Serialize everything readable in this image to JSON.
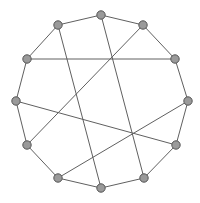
{
  "figure": {
    "kind": "circular-graph-drawing",
    "width": 200,
    "height": 203,
    "background_color": "#ffffff"
  },
  "chart_data": {
    "type": "scatter",
    "title": "",
    "subtitle": "",
    "xlabel": "",
    "ylabel": "",
    "grid": false,
    "legend": null,
    "axis_visible": false,
    "xlim": [
      0,
      200
    ],
    "ylim": [
      0,
      203
    ],
    "graph": {
      "layout": "circular",
      "node_count": 12,
      "edge_count": 18,
      "directed": false,
      "center": [
        101.5,
        101.5
      ],
      "radius": 87,
      "node_style": {
        "fill": "#9a9a9a",
        "stroke": "#555555",
        "radius": 4.2,
        "shape": "circle"
      },
      "edge_style": {
        "stroke": "#606060",
        "width": 1.0
      },
      "nodes": [
        {
          "id": 0,
          "label": "0",
          "x": 101,
          "y": 15
        },
        {
          "id": 1,
          "label": "1",
          "x": 143,
          "y": 25
        },
        {
          "id": 2,
          "label": "2",
          "x": 175,
          "y": 59
        },
        {
          "id": 3,
          "label": "3",
          "x": 188,
          "y": 101
        },
        {
          "id": 4,
          "label": "4",
          "x": 176,
          "y": 145
        },
        {
          "id": 5,
          "label": "5",
          "x": 144,
          "y": 178
        },
        {
          "id": 6,
          "label": "6",
          "x": 101,
          "y": 188
        },
        {
          "id": 7,
          "label": "7",
          "x": 58,
          "y": 178
        },
        {
          "id": 8,
          "label": "8",
          "x": 27,
          "y": 145
        },
        {
          "id": 9,
          "label": "9",
          "x": 16,
          "y": 101
        },
        {
          "id": 10,
          "label": "10",
          "x": 27,
          "y": 59
        },
        {
          "id": 11,
          "label": "11",
          "x": 58,
          "y": 25
        }
      ],
      "edges": [
        {
          "source": 0,
          "target": 1,
          "kind": "perimeter"
        },
        {
          "source": 1,
          "target": 2,
          "kind": "perimeter"
        },
        {
          "source": 2,
          "target": 3,
          "kind": "perimeter"
        },
        {
          "source": 3,
          "target": 4,
          "kind": "perimeter"
        },
        {
          "source": 4,
          "target": 5,
          "kind": "perimeter"
        },
        {
          "source": 5,
          "target": 6,
          "kind": "perimeter"
        },
        {
          "source": 6,
          "target": 7,
          "kind": "perimeter"
        },
        {
          "source": 7,
          "target": 8,
          "kind": "perimeter"
        },
        {
          "source": 8,
          "target": 9,
          "kind": "perimeter"
        },
        {
          "source": 9,
          "target": 10,
          "kind": "perimeter"
        },
        {
          "source": 10,
          "target": 11,
          "kind": "perimeter"
        },
        {
          "source": 11,
          "target": 0,
          "kind": "perimeter"
        },
        {
          "source": 10,
          "target": 2,
          "kind": "chord"
        },
        {
          "source": 11,
          "target": 6,
          "kind": "chord"
        },
        {
          "source": 0,
          "target": 5,
          "kind": "chord"
        },
        {
          "source": 1,
          "target": 8,
          "kind": "chord"
        },
        {
          "source": 9,
          "target": 4,
          "kind": "chord"
        },
        {
          "source": 7,
          "target": 3,
          "kind": "chord"
        }
      ]
    }
  }
}
